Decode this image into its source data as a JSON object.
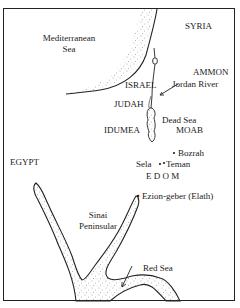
{
  "map": {
    "labels": {
      "mediterranean": "Mediterranean",
      "sea": "Sea",
      "syria": "SYRIA",
      "ammon": "AMMON",
      "jordan_river": "Jordan River",
      "israel": "ISRAEL",
      "judah": "JUDAH",
      "dead_sea": "Dead Sea",
      "idumea": "IDUMEA",
      "moab": "MOAB",
      "bozrah": "Bozrah",
      "sela": "Sela",
      "teman": "Teman",
      "edom": "E D O M",
      "egypt": "EGYPT",
      "ezion_geber": "Ezion-geber (Elath)",
      "sinai": "Sinai",
      "peninsular": "Peninsular",
      "red_sea": "Red Sea"
    },
    "colors": {
      "ink": "#222222",
      "background": "#ffffff"
    }
  }
}
